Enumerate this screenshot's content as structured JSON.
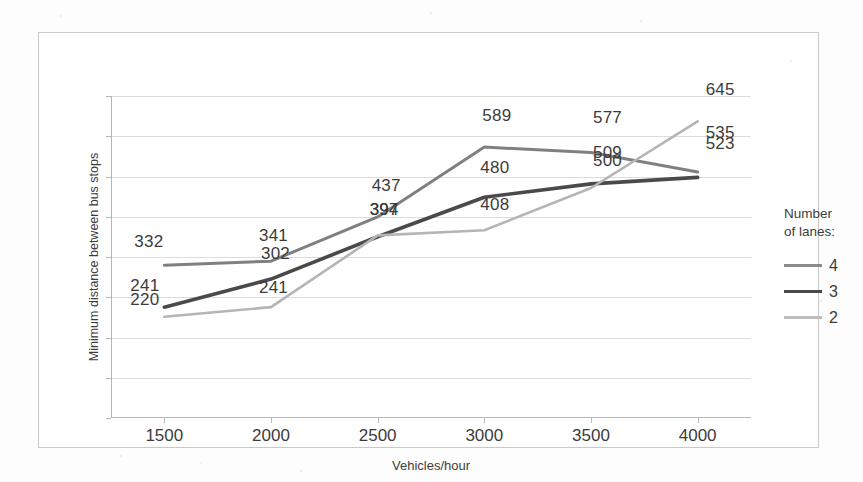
{
  "chart_data": {
    "type": "line",
    "title": "",
    "xlabel": "Vehicles/hour",
    "ylabel": "Minimum distance between bus stops",
    "x": [
      1500,
      2000,
      2500,
      3000,
      3500,
      4000
    ],
    "xticklabels": [
      "1500",
      "2000",
      "2500",
      "3000",
      "3500",
      "4000"
    ],
    "xlim": [
      1250,
      4250
    ],
    "ylim": [
      0,
      700
    ],
    "yticklabels": [],
    "grid": "horizontal",
    "legend_position": "right",
    "legend_title": "Number of lanes:",
    "series": [
      {
        "name": "4",
        "color": "#808080",
        "values": [
          332,
          341,
          437,
          589,
          577,
          535
        ],
        "labels": [
          "332",
          "341",
          "437",
          "589",
          "577",
          "535"
        ]
      },
      {
        "name": "3",
        "color": "#4a4a4a",
        "values": [
          241,
          302,
          394,
          480,
          509,
          523
        ],
        "labels": [
          "241",
          "302",
          "394",
          "480",
          "509",
          "523"
        ]
      },
      {
        "name": "2",
        "color": "#b5b5b5",
        "values": [
          220,
          241,
          397,
          408,
          500,
          645
        ],
        "labels": [
          "220",
          "241",
          "397",
          "408",
          "500",
          "645"
        ]
      }
    ]
  },
  "legend": {
    "title_line1": "Number",
    "title_line2": "of lanes:",
    "items": [
      {
        "label": "4",
        "color": "#8a8a8a"
      },
      {
        "label": "3",
        "color": "#4a4a4a"
      },
      {
        "label": "2",
        "color": "#bdbdbd"
      }
    ]
  },
  "axes": {
    "x_title": "Vehicles/hour",
    "y_title": "Minimum distance between bus stops",
    "x_ticks": [
      "1500",
      "2000",
      "2500",
      "3000",
      "3500",
      "4000"
    ]
  }
}
